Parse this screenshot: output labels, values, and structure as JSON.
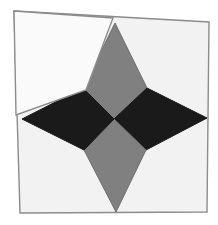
{
  "figure": {
    "canvas": {
      "width": 218,
      "height": 225,
      "background": "#ffffff"
    },
    "colors": {
      "background": "#ffffff",
      "plate_fill": "#f2f2f2",
      "plate_stroke": "#8c8c8c",
      "star_gray": "#808080",
      "star_black": "#1a1a1a",
      "flap_fill": "#fafafa",
      "flap_stroke": "#8c8c8c",
      "star_stroke": "#6e6e6e"
    },
    "shapes": [
      {
        "name": "base-plate",
        "kind": "polygon",
        "fill": "#f2f2f2",
        "stroke": "#8c8c8c",
        "stroke_width": 1.4,
        "points": "14,11 209,22 207,212 20,213"
      },
      {
        "name": "star-point-top",
        "kind": "polygon",
        "fill": "#808080",
        "stroke": "#6e6e6e",
        "stroke_width": 1,
        "points": "115,23 147,88 114,119 83,88"
      },
      {
        "name": "star-point-right",
        "kind": "polygon",
        "fill": "#1a1a1a",
        "stroke": "#1a1a1a",
        "stroke_width": 1,
        "points": "207,118 147,88 114,119 146,150"
      },
      {
        "name": "star-point-bottom",
        "kind": "polygon",
        "fill": "#808080",
        "stroke": "#6e6e6e",
        "stroke_width": 1,
        "points": "116,212 84,150 114,119 146,150"
      },
      {
        "name": "star-point-left",
        "kind": "polygon",
        "fill": "#1a1a1a",
        "stroke": "#1a1a1a",
        "stroke_width": 1,
        "points": "22,119 83,88 114,119 84,150"
      },
      {
        "name": "corner-flap",
        "kind": "polygon",
        "fill": "#fafafa",
        "stroke": "#8c8c8c",
        "stroke_width": 1.4,
        "points": "14,11 113,18 86,90 16,115"
      }
    ],
    "geometry": {
      "star_center": {
        "x": 114,
        "y": 119
      },
      "tips": {
        "top": {
          "x": 115,
          "y": 23
        },
        "right": {
          "x": 207,
          "y": 118
        },
        "bottom": {
          "x": 116,
          "y": 212
        },
        "left": {
          "x": 22,
          "y": 119
        }
      },
      "shoulders": {
        "top_left": {
          "x": 83,
          "y": 88
        },
        "top_right": {
          "x": 147,
          "y": 88
        },
        "bottom_right": {
          "x": 146,
          "y": 150
        },
        "bottom_left": {
          "x": 84,
          "y": 150
        }
      }
    }
  }
}
